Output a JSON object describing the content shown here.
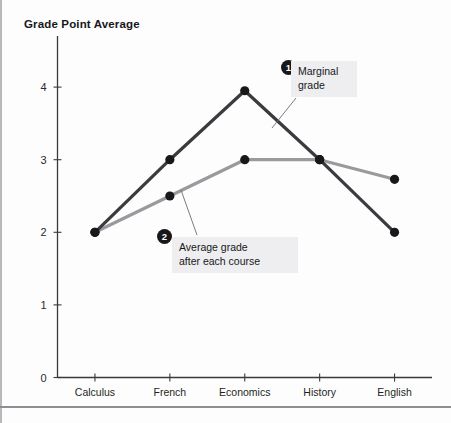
{
  "figure": {
    "title": "Grade Point Average",
    "background_color": "#fdfdfd",
    "rule_color": "#8e8e95"
  },
  "callouts": [
    {
      "number": "1",
      "text": "Marginal\ngrade",
      "refers_to_series": "Marginal grade",
      "box_color": "#eeeef0"
    },
    {
      "number": "2",
      "text": "Average grade\nafter each course",
      "refers_to_series": "Average grade after each course",
      "box_color": "#eeeef0"
    }
  ],
  "chart_data": {
    "type": "line",
    "title": "Grade Point Average",
    "xlabel": "",
    "ylabel": "Grade Point Average",
    "categories": [
      "Calculus",
      "French",
      "Economics",
      "History",
      "English"
    ],
    "ylim": [
      0,
      4.4
    ],
    "yticks": [
      0,
      1,
      2,
      3,
      4
    ],
    "ytick_labels": [
      "0",
      "1",
      "2",
      "3",
      "4"
    ],
    "grid": false,
    "legend_position": "inline-annotations",
    "series": [
      {
        "name": "Marginal grade",
        "color": "#3b3b3f",
        "marker": "circle",
        "marker_color": "#18181b",
        "values": [
          2.0,
          3.0,
          3.95,
          3.0,
          2.0
        ]
      },
      {
        "name": "Average grade after each course",
        "color": "#9a9a9e",
        "marker": "circle",
        "marker_color": "#18181b",
        "values": [
          2.0,
          2.5,
          3.0,
          3.0,
          2.73
        ]
      }
    ]
  }
}
